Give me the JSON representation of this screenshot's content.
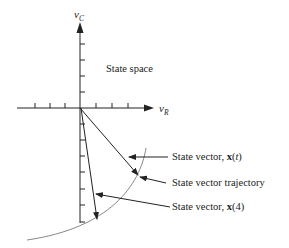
{
  "diagram": {
    "title": "State space",
    "axes": {
      "vertical": {
        "symbol": "v",
        "subscript": "C"
      },
      "horizontal": {
        "symbol": "v",
        "subscript": "R"
      }
    },
    "annotations": [
      {
        "prefix": "State vector, ",
        "bold": "x",
        "paren_open": "(",
        "arg": "t",
        "paren_close": ")"
      },
      {
        "text": "State vector trajectory"
      },
      {
        "prefix": "State vector, ",
        "bold": "x",
        "paren_open": "(",
        "arg": "4",
        "paren_close": ")"
      }
    ],
    "colors": {
      "ink": "#222222",
      "curve": "#888888"
    }
  }
}
